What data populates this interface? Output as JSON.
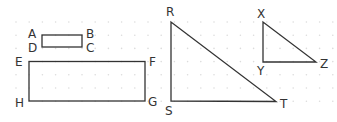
{
  "colors": {
    "stroke": "#333333",
    "grid_dot": "#dcdcdc",
    "background": "#ffffff"
  },
  "figures": {
    "rect_small": {
      "vertices": {
        "A": [
          42,
          35
        ],
        "B": [
          82,
          35
        ],
        "C": [
          82,
          47
        ],
        "D": [
          42,
          47
        ]
      },
      "labels": {
        "A": "A",
        "B": "B",
        "C": "C",
        "D": "D"
      }
    },
    "rect_large": {
      "vertices": {
        "E": [
          29,
          61
        ],
        "F": [
          145,
          61
        ],
        "G": [
          145,
          101
        ],
        "H": [
          29,
          101
        ]
      },
      "labels": {
        "E": "E",
        "F": "F",
        "G": "G",
        "H": "H"
      }
    },
    "triangle_large": {
      "vertices": {
        "R": [
          171,
          22
        ],
        "S": [
          171,
          101
        ],
        "T": [
          276,
          101
        ]
      },
      "labels": {
        "R": "R",
        "S": "S",
        "T": "T"
      }
    },
    "triangle_small": {
      "vertices": {
        "X": [
          263,
          22
        ],
        "Y": [
          263,
          62
        ],
        "Z": [
          316,
          62
        ]
      },
      "labels": {
        "X": "X",
        "Y": "Y",
        "Z": "Z"
      }
    }
  }
}
